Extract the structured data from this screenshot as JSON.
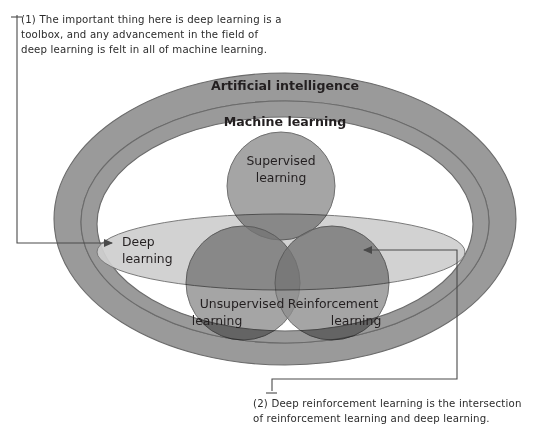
{
  "figure": {
    "type": "venn-euler-diagram",
    "title_visible": false,
    "annotations": [
      {
        "id": "annotation-1",
        "marker": "(1)",
        "text": "(1) The important thing here is deep learning is a\ntoolbox, and any advancement in the field of\ndeep learning is felt in all of machine learning.",
        "points_to": "deep-learning-ellipse",
        "leader": "bracket-left-then-right-arrow"
      },
      {
        "id": "annotation-2",
        "marker": "(2)",
        "text": "(2) Deep reinforcement learning is the intersection\nof reinforcement learning and deep learning.",
        "points_to": "deep-learning-reinforcement-learning-intersection",
        "leader": "bracket-bottom-then-left-arrow"
      }
    ],
    "regions": [
      {
        "id": "artificial-intelligence",
        "label": "Artificial intelligence",
        "shape": "ellipse-ring",
        "weight": "bold",
        "fill": "#9a9a9a"
      },
      {
        "id": "machine-learning",
        "label": "Machine learning",
        "shape": "ellipse-ring",
        "weight": "bold",
        "fill": "#9a9a9a"
      },
      {
        "id": "deep-learning",
        "label": "Deep learning",
        "shape": "ellipse",
        "weight": "regular",
        "fill": "#cfcfcf"
      },
      {
        "id": "supervised-learning",
        "label": "Supervised learning",
        "shape": "circle",
        "weight": "regular",
        "fill": "#8e8e8e"
      },
      {
        "id": "unsupervised-learning",
        "label": "Unsupervised learning",
        "shape": "circle",
        "weight": "regular",
        "fill": "#8e8e8e"
      },
      {
        "id": "reinforcement-learning",
        "label": "Reinforcement learning",
        "shape": "circle",
        "weight": "regular",
        "fill": "#8e8e8e"
      }
    ],
    "labels": {
      "artificial_intelligence": "Artificial intelligence",
      "machine_learning": "Machine learning",
      "deep_learning_line1": "Deep",
      "deep_learning_line2": "learning",
      "supervised_line1": "Supervised",
      "supervised_line2": "learning",
      "unsupervised_line1": "Unsupervised",
      "unsupervised_line2": "learning",
      "reinforcement_line1": "Reinforcement",
      "reinforcement_line2": "learning"
    },
    "colors": {
      "background": "#ffffff",
      "ring_fill": "#9a9a9a",
      "ring_stroke": "#6b6b6b",
      "deep_learning_fill": "#cfcfcf",
      "circle_fill": "#8e8e8e",
      "circle_stroke": "#6f6f6f",
      "text": "#231f20",
      "annotation_text": "#2b2b2b",
      "leader_line": "#4a4a4a"
    }
  }
}
